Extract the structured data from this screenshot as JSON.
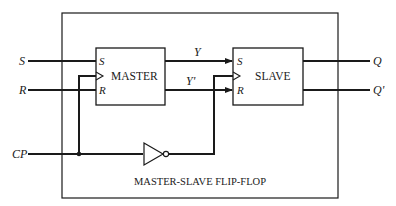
{
  "diagram": {
    "title": "MASTER-SLAVE FLIP-FLOP",
    "inputs": {
      "s": "S",
      "r": "R",
      "cp": "CP"
    },
    "outputs": {
      "q": "Q",
      "q_prime": "Q'"
    },
    "intermediate": {
      "y": "Y",
      "y_prime": "Y'"
    },
    "master": {
      "label": "MASTER",
      "pins": {
        "s": "S",
        "r": "R",
        "clock": "clock"
      }
    },
    "slave": {
      "label": "SLAVE",
      "pins": {
        "s": "S",
        "r": "R",
        "clock": "clock"
      }
    },
    "inverter": {
      "label": "NOT"
    },
    "colors": {
      "line": "#1a1a1a",
      "background": "#ffffff"
    }
  }
}
